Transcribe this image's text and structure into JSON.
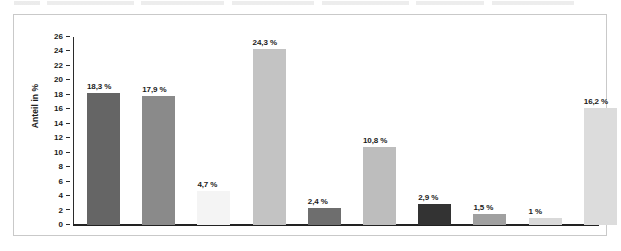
{
  "chart_data": {
    "type": "bar",
    "title": "",
    "subtitle": "",
    "xlabel": "",
    "ylabel": "Anteil in %",
    "ylim": [
      0,
      26
    ],
    "ytick_step": 2,
    "yticks": [
      "0",
      "2",
      "4",
      "6",
      "8",
      "10",
      "12",
      "14",
      "16",
      "18",
      "20",
      "22",
      "24",
      "26"
    ],
    "grid": false,
    "legend": "none",
    "xticklabels": [
      "",
      "",
      "",
      "",
      "",
      "",
      "",
      "",
      "",
      ""
    ],
    "categories": [
      "1",
      "2",
      "3",
      "4",
      "5",
      "6",
      "7",
      "8",
      "9",
      "10"
    ],
    "values": [
      18.3,
      17.9,
      4.7,
      24.3,
      2.4,
      10.8,
      2.9,
      1.5,
      1.0,
      16.2
    ],
    "data_labels": [
      "18,3 %",
      "17,9 %",
      "4,7 %",
      "24,3 %",
      "2,4 %",
      "10,8 %",
      "2,9 %",
      "1,5 %",
      "1 %",
      "16,2 %"
    ],
    "bar_colors": [
      "#656565",
      "#8a8a8a",
      "#f4f4f4",
      "#c3c3c3",
      "#6e6e6e",
      "#bdbdbd",
      "#333333",
      "#a0a0a0",
      "#d9d9d9",
      "#dcdcdc"
    ]
  },
  "frame": {
    "border_color": "#c9c9c9",
    "background": "#ffffff"
  },
  "axis": {
    "color": "#222222",
    "text_color": "#1a1a1a"
  }
}
